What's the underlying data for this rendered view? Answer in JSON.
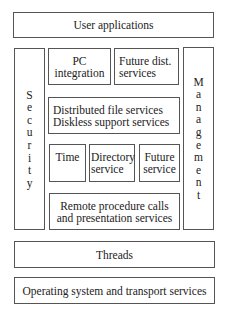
{
  "diagram": {
    "user_applications": "User applications",
    "security": "Security",
    "management": "Management",
    "pc_integration": [
      "PC",
      "integration"
    ],
    "future_dist_services": [
      "Future dist.",
      "services"
    ],
    "distributed_file": [
      "Distributed file services",
      "Diskless support services"
    ],
    "time": "Time",
    "directory_service": [
      "Directory",
      "service"
    ],
    "future_service": [
      "Future",
      "service"
    ],
    "rpc": [
      "Remote procedure calls",
      "and presentation services"
    ],
    "threads": "Threads",
    "os_transport": "Operating system and transport services"
  }
}
